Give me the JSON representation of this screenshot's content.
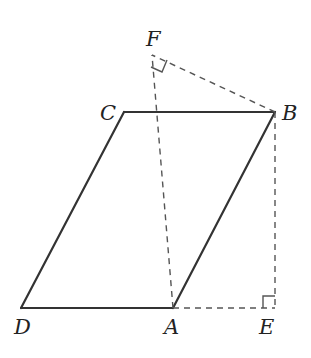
{
  "diagram": {
    "type": "geometry",
    "points": {
      "A": {
        "label": "A",
        "x": 173,
        "y": 308
      },
      "B": {
        "label": "B",
        "x": 275,
        "y": 112
      },
      "C": {
        "label": "C",
        "x": 124,
        "y": 112
      },
      "D": {
        "label": "D",
        "x": 21,
        "y": 308
      },
      "E": {
        "label": "E",
        "x": 275,
        "y": 308
      },
      "F": {
        "label": "F",
        "x": 152,
        "y": 55
      }
    },
    "solid_segments": [
      "DA",
      "AB",
      "BC",
      "CD"
    ],
    "dashed_segments": [
      "AE",
      "BE",
      "CF",
      "AC",
      "BF"
    ],
    "right_angles": [
      "E",
      "F"
    ],
    "colors": {
      "stroke": "#333333",
      "dashed": "#555555"
    }
  }
}
